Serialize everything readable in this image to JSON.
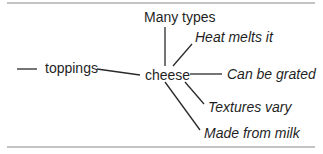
{
  "diagram": {
    "center": {
      "label": "cheese"
    },
    "parent": {
      "label": "toppings"
    },
    "branches": [
      {
        "label": "Many types",
        "style": "normal"
      },
      {
        "label": "Heat melts it",
        "style": "italic"
      },
      {
        "label": "Can be grated",
        "style": "italic"
      },
      {
        "label": "Textures vary",
        "style": "italic"
      },
      {
        "label": "Made from milk",
        "style": "italic"
      }
    ]
  }
}
